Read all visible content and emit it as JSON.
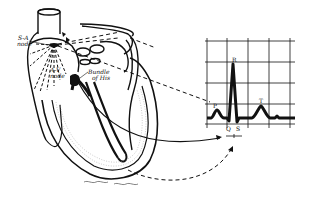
{
  "diagram": {
    "title": "",
    "heart_labels": {
      "sa_node_line1": "S-A",
      "sa_node_line2": "node",
      "av_node_line1": "A-V",
      "av_node_line2": "node",
      "bundle_line1": "Bundle",
      "bundle_line2": "of His"
    },
    "ecg_labels": {
      "p": "P",
      "q": "Q",
      "r": "R",
      "s": "S",
      "t": "T"
    },
    "signature": "~ ~ ~"
  },
  "colors": {
    "ink": "#111111",
    "background": "#ffffff",
    "shading": "#bdbdbd"
  }
}
